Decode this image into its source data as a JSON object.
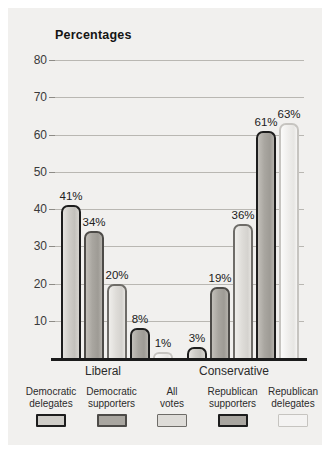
{
  "panel": {
    "background_color": "#f1f0ee"
  },
  "chart_data": {
    "type": "bar",
    "title": "Percentages",
    "xlabel": "",
    "ylabel": "",
    "ylim": [
      0,
      80
    ],
    "yticks": [
      10,
      20,
      30,
      40,
      50,
      60,
      70,
      80
    ],
    "grid": true,
    "legend_position": "bottom",
    "categories": [
      "Liberal",
      "Conservative"
    ],
    "series": [
      {
        "name": "Democratic delegates",
        "values": [
          41,
          3
        ],
        "labels": [
          "41%",
          "3%"
        ],
        "color": "#cfcdc8",
        "border_color": "#1d1d1d"
      },
      {
        "name": "Democratic supporters",
        "values": [
          34,
          19
        ],
        "labels": [
          "34%",
          "19%"
        ],
        "color": "#a9a6a0",
        "border_color": "#4d4b48"
      },
      {
        "name": "All votes",
        "values": [
          20,
          36
        ],
        "labels": [
          "20%",
          "36%"
        ],
        "color": "#dedcd8",
        "border_color": "#6e6c68"
      },
      {
        "name": "Republican supporters",
        "values": [
          8,
          61
        ],
        "labels": [
          "8%",
          "61%"
        ],
        "color": "#a9a6a0",
        "border_color": "#1d1d1d"
      },
      {
        "name": "Republican delegates",
        "values": [
          1,
          63
        ],
        "labels": [
          "1%",
          "63%"
        ],
        "color": "#f4f3f2",
        "border_color": "#c6c4c0"
      }
    ],
    "bars": [
      {
        "group": "Liberal",
        "series": "Democratic delegates",
        "value": 41,
        "label": "41%",
        "style": "demdel"
      },
      {
        "group": "Liberal",
        "series": "Democratic supporters",
        "value": 34,
        "label": "34%",
        "style": "demsup"
      },
      {
        "group": "Liberal",
        "series": "All votes",
        "value": 20,
        "label": "20%",
        "style": "allv"
      },
      {
        "group": "Liberal",
        "series": "Republican supporters",
        "value": 8,
        "label": "8%",
        "style": "repsup"
      },
      {
        "group": "Liberal",
        "series": "Republican delegates",
        "value": 1,
        "label": "1%",
        "style": "repdel"
      },
      {
        "group": "Conservative",
        "series": "Democratic delegates",
        "value": 3,
        "label": "3%",
        "style": "demdel"
      },
      {
        "group": "Conservative",
        "series": "Democratic supporters",
        "value": 19,
        "label": "19%",
        "style": "demsup"
      },
      {
        "group": "Conservative",
        "series": "All votes",
        "value": 36,
        "label": "36%",
        "style": "allv"
      },
      {
        "group": "Conservative",
        "series": "Republican supporters",
        "value": 61,
        "label": "61%",
        "style": "repsup"
      },
      {
        "group": "Conservative",
        "series": "Republican delegates",
        "value": 63,
        "label": "63%",
        "style": "repdel"
      }
    ]
  },
  "legend": {
    "items": [
      {
        "line1": "Democratic",
        "line2": "delegates",
        "style": "demdel"
      },
      {
        "line1": "Democratic",
        "line2": "supporters",
        "style": "demsup"
      },
      {
        "line1": "All",
        "line2": "votes",
        "style": "allv"
      },
      {
        "line1": "Republican",
        "line2": "supporters",
        "style": "repsup"
      },
      {
        "line1": "Republican",
        "line2": "delegates",
        "style": "repdel"
      }
    ]
  }
}
